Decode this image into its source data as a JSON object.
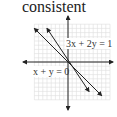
{
  "title": "consistent",
  "chart_data": {
    "type": "line",
    "title": "consistent",
    "xlabel": "",
    "ylabel": "",
    "xlim": [
      -11,
      11
    ],
    "ylim": [
      -11,
      11
    ],
    "grid": true,
    "series": [
      {
        "name": "3x + 2y = 1",
        "label": "3x + 2y = 1",
        "x": [
          -5,
          5
        ],
        "y": [
          8,
          -7
        ],
        "arrows": "both"
      },
      {
        "name": "x + y = 0",
        "label": "x + y = 0",
        "x": [
          -8,
          8
        ],
        "y": [
          8,
          -8
        ],
        "arrows": "both"
      }
    ],
    "colors": {
      "line": "#222222",
      "grid": "#dddddd",
      "axis": "#222222"
    }
  }
}
